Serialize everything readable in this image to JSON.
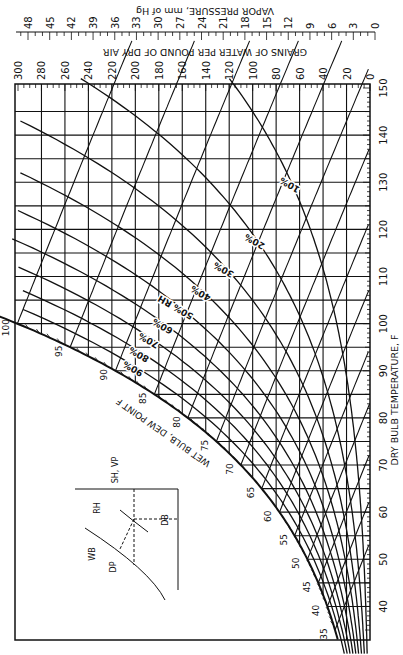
{
  "chart_data": {
    "type": "line",
    "orientation": "rotated-90",
    "xlabel": "DRY BULB TEMPERATURE, F",
    "ylabel": "GRAINS OF WATER PER POUND OF DRY AIR",
    "secondary_ylabel": "VAPOR PRESSURE, mm of Hg",
    "saturation_label": "WET BULB, DEW POINT F",
    "dry_bulb_ticks": [
      40,
      50,
      60,
      70,
      80,
      90,
      100,
      110,
      120,
      130,
      140,
      150
    ],
    "dry_bulb_range": [
      35,
      150
    ],
    "grains_ticks": [
      0,
      20,
      40,
      60,
      80,
      100,
      120,
      140,
      160,
      180,
      200,
      220,
      240,
      260,
      280,
      300
    ],
    "grains_range": [
      0,
      300
    ],
    "vapor_pressure_ticks": [
      0,
      3,
      6,
      9,
      12,
      15,
      18,
      21,
      24,
      27,
      30,
      33,
      36,
      39,
      42,
      45,
      48
    ],
    "vapor_pressure_range": [
      0,
      48
    ],
    "saturation_temp_labels": [
      35,
      40,
      45,
      50,
      55,
      60,
      65,
      70,
      75,
      80,
      85,
      90,
      95,
      100
    ],
    "relative_humidity_curves": [
      {
        "label": "10%",
        "rh": 10
      },
      {
        "label": "20%",
        "rh": 20
      },
      {
        "label": "30%",
        "rh": 30
      },
      {
        "label": "40%",
        "rh": 40
      },
      {
        "label": "50% RH",
        "rh": 50
      },
      {
        "label": "60%",
        "rh": 60
      },
      {
        "label": "70%",
        "rh": 70
      },
      {
        "label": "80%",
        "rh": 80
      },
      {
        "label": "90%",
        "rh": 90
      }
    ],
    "grid": true
  },
  "inset_diagram": {
    "labels": {
      "sh_vp": "SH, VP",
      "rh": "RH",
      "wb": "WB",
      "dp": "DP",
      "db": "DB"
    }
  },
  "colors": {
    "ink": "#111111",
    "paper": "#ffffff"
  }
}
